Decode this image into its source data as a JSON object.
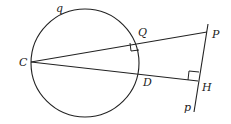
{
  "diagram": {
    "labels": {
      "circle": "q",
      "C": "C",
      "Q": "Q",
      "P": "P",
      "D": "D",
      "H": "H",
      "line": "p"
    },
    "colors": {
      "stroke": "#222222",
      "background": "#ffffff"
    }
  }
}
